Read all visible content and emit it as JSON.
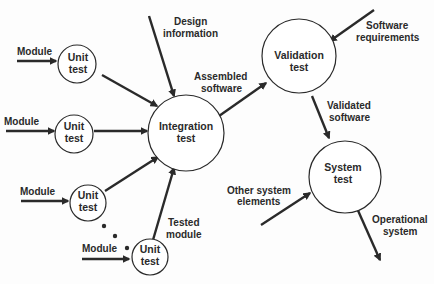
{
  "diagram": {
    "type": "flow",
    "nodes": [
      {
        "id": "unit1",
        "label": [
          "Unit",
          "test"
        ]
      },
      {
        "id": "unit2",
        "label": [
          "Unit",
          "test"
        ]
      },
      {
        "id": "unit3",
        "label": [
          "Unit",
          "test"
        ]
      },
      {
        "id": "unit4",
        "label": [
          "Unit",
          "test"
        ]
      },
      {
        "id": "integration",
        "label": [
          "Integration",
          "test"
        ]
      },
      {
        "id": "validation",
        "label": [
          "Validation",
          "test"
        ]
      },
      {
        "id": "system",
        "label": [
          "System",
          "test"
        ]
      }
    ],
    "edge_labels": {
      "module1": "Module",
      "module2": "Module",
      "module3": "Module",
      "module4": "Module",
      "design_information": [
        "Design",
        "information"
      ],
      "assembled_software": [
        "Assembled",
        "software"
      ],
      "tested_module": [
        "Tested",
        "module"
      ],
      "software_requirements": [
        "Software",
        "requirements"
      ],
      "validated_software": [
        "Validated",
        "software"
      ],
      "other_system_elements": [
        "Other system",
        "elements"
      ],
      "operational_system": [
        "Operational",
        "system"
      ]
    },
    "edges": [
      {
        "from": "Module",
        "to": "unit1"
      },
      {
        "from": "Module",
        "to": "unit2"
      },
      {
        "from": "Module",
        "to": "unit3"
      },
      {
        "from": "Module",
        "to": "unit4"
      },
      {
        "from": "unit1",
        "to": "integration"
      },
      {
        "from": "unit2",
        "to": "integration"
      },
      {
        "from": "unit3",
        "to": "integration"
      },
      {
        "from": "unit4",
        "to": "integration",
        "label": "Tested module"
      },
      {
        "from": "Design information",
        "to": "integration"
      },
      {
        "from": "integration",
        "to": "validation",
        "label": "Assembled software"
      },
      {
        "from": "Software requirements",
        "to": "validation"
      },
      {
        "from": "validation",
        "to": "system",
        "label": "Validated software"
      },
      {
        "from": "Other system elements",
        "to": "system"
      },
      {
        "from": "system",
        "to": "Operational system"
      }
    ],
    "ellipsis": "• • •"
  }
}
